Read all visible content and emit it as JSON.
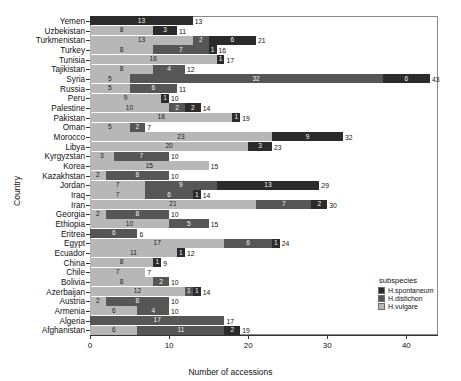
{
  "chart_data": {
    "type": "bar",
    "orientation": "horizontal",
    "stacked": true,
    "title": "",
    "xlabel": "Number of accessions",
    "ylabel": "Country",
    "xlim": [
      0,
      44
    ],
    "xticks": [
      0,
      10,
      20,
      30,
      40
    ],
    "grid": false,
    "legend": {
      "title": "subspecies",
      "position": "bottom-right",
      "entries": [
        {
          "name": "H.spontaneum",
          "color": "#2b2b2b"
        },
        {
          "name": "H.distichon",
          "color": "#565656"
        },
        {
          "name": "H.vulgare",
          "color": "#b7b7b7"
        }
      ]
    },
    "series": [
      {
        "name": "H.vulgare",
        "color": "#b7b7b7"
      },
      {
        "name": "H.distichon",
        "color": "#565656"
      },
      {
        "name": "H.spontaneum",
        "color": "#2b2b2b"
      }
    ],
    "categories": [
      "Yemen",
      "Uzbekistan",
      "Turkmenistan",
      "Turkey",
      "Tunisia",
      "Tajikistan",
      "Syria",
      "Russia",
      "Peru",
      "Palestine",
      "Pakistan",
      "Oman",
      "Morocco",
      "Libya",
      "Kyrgyzstan",
      "Korea",
      "Kazakhstan",
      "Jordan",
      "Iraq",
      "Iran",
      "Georgia",
      "Ethiopia",
      "Eritrea",
      "Egypt",
      "Ecuador",
      "China",
      "Chile",
      "Bolivia",
      "Azerbaijan",
      "Austria",
      "Armenia",
      "Algeria",
      "Afghanistan"
    ],
    "bars": [
      {
        "country": "Yemen",
        "segments": [
          {
            "subspecies": "H.spontaneum",
            "value": 13,
            "shade": "dark"
          }
        ],
        "total": 13
      },
      {
        "country": "Uzbekistan",
        "segments": [
          {
            "subspecies": "H.vulgare",
            "value": 8,
            "shade": "light"
          },
          {
            "subspecies": "H.spontaneum",
            "value": 3,
            "shade": "dark"
          }
        ],
        "total": 11
      },
      {
        "country": "Turkmenistan",
        "segments": [
          {
            "subspecies": "H.vulgare",
            "value": 13,
            "shade": "light"
          },
          {
            "subspecies": "H.distichon",
            "value": 2,
            "shade": "mid"
          },
          {
            "subspecies": "H.spontaneum",
            "value": 6,
            "shade": "dark"
          }
        ],
        "total": 21
      },
      {
        "country": "Turkey",
        "segments": [
          {
            "subspecies": "H.vulgare",
            "value": 8,
            "shade": "light"
          },
          {
            "subspecies": "H.distichon",
            "value": 7,
            "shade": "mid"
          },
          {
            "subspecies": "H.spontaneum",
            "value": 1,
            "shade": "dark"
          }
        ],
        "total": 16
      },
      {
        "country": "Tunisia",
        "segments": [
          {
            "subspecies": "H.vulgare",
            "value": 16,
            "shade": "light"
          },
          {
            "subspecies": "H.spontaneum",
            "value": 1,
            "shade": "dark"
          }
        ],
        "total": 17
      },
      {
        "country": "Tajikistan",
        "segments": [
          {
            "subspecies": "H.vulgare",
            "value": 8,
            "shade": "light"
          },
          {
            "subspecies": "H.distichon",
            "value": 4,
            "shade": "mid"
          }
        ],
        "total": 12
      },
      {
        "country": "Syria",
        "segments": [
          {
            "subspecies": "H.vulgare",
            "value": 5,
            "shade": "light"
          },
          {
            "subspecies": "H.distichon",
            "value": 32,
            "shade": "mid"
          },
          {
            "subspecies": "H.spontaneum",
            "value": 6,
            "shade": "dark"
          }
        ],
        "total": 43
      },
      {
        "country": "Russia",
        "segments": [
          {
            "subspecies": "H.vulgare",
            "value": 5,
            "shade": "light"
          },
          {
            "subspecies": "H.distichon",
            "value": 6,
            "shade": "mid"
          }
        ],
        "total": 11
      },
      {
        "country": "Peru",
        "segments": [
          {
            "subspecies": "H.vulgare",
            "value": 9,
            "shade": "light"
          },
          {
            "subspecies": "H.spontaneum",
            "value": 1,
            "shade": "dark"
          }
        ],
        "total": 10
      },
      {
        "country": "Palestine",
        "segments": [
          {
            "subspecies": "H.vulgare",
            "value": 10,
            "shade": "light"
          },
          {
            "subspecies": "H.distichon",
            "value": 2,
            "shade": "mid"
          },
          {
            "subspecies": "H.spontaneum",
            "value": 2,
            "shade": "dark"
          }
        ],
        "total": 14
      },
      {
        "country": "Pakistan",
        "segments": [
          {
            "subspecies": "H.vulgare",
            "value": 18,
            "shade": "light"
          },
          {
            "subspecies": "H.spontaneum",
            "value": 1,
            "shade": "dark"
          }
        ],
        "total": 19
      },
      {
        "country": "Oman",
        "segments": [
          {
            "subspecies": "H.vulgare",
            "value": 5,
            "shade": "light"
          },
          {
            "subspecies": "H.distichon",
            "value": 2,
            "shade": "mid"
          }
        ],
        "total": 7
      },
      {
        "country": "Morocco",
        "segments": [
          {
            "subspecies": "H.vulgare",
            "value": 23,
            "shade": "light"
          },
          {
            "subspecies": "H.spontaneum",
            "value": 9,
            "shade": "dark"
          }
        ],
        "total": 32
      },
      {
        "country": "Libya",
        "segments": [
          {
            "subspecies": "H.vulgare",
            "value": 20,
            "shade": "light"
          },
          {
            "subspecies": "H.spontaneum",
            "value": 3,
            "shade": "dark"
          }
        ],
        "total": 23
      },
      {
        "country": "Kyrgyzstan",
        "segments": [
          {
            "subspecies": "H.vulgare",
            "value": 3,
            "shade": "light"
          },
          {
            "subspecies": "H.distichon",
            "value": 7,
            "shade": "mid"
          }
        ],
        "total": 10
      },
      {
        "country": "Korea",
        "segments": [
          {
            "subspecies": "H.vulgare",
            "value": 15,
            "shade": "light"
          }
        ],
        "total": 15
      },
      {
        "country": "Kazakhstan",
        "segments": [
          {
            "subspecies": "H.vulgare",
            "value": 2,
            "shade": "light"
          },
          {
            "subspecies": "H.distichon",
            "value": 8,
            "shade": "mid"
          }
        ],
        "total": 10
      },
      {
        "country": "Jordan",
        "segments": [
          {
            "subspecies": "H.vulgare",
            "value": 7,
            "shade": "light"
          },
          {
            "subspecies": "H.distichon",
            "value": 9,
            "shade": "mid"
          },
          {
            "subspecies": "H.spontaneum",
            "value": 13,
            "shade": "dark"
          }
        ],
        "total": 29
      },
      {
        "country": "Iraq",
        "segments": [
          {
            "subspecies": "H.vulgare",
            "value": 7,
            "shade": "light"
          },
          {
            "subspecies": "H.distichon",
            "value": 6,
            "shade": "mid"
          },
          {
            "subspecies": "H.spontaneum",
            "value": 1,
            "shade": "dark"
          }
        ],
        "total": 14
      },
      {
        "country": "Iran",
        "segments": [
          {
            "subspecies": "H.vulgare",
            "value": 21,
            "shade": "light"
          },
          {
            "subspecies": "H.distichon",
            "value": 7,
            "shade": "mid"
          },
          {
            "subspecies": "H.spontaneum",
            "value": 2,
            "shade": "dark"
          }
        ],
        "total": 30
      },
      {
        "country": "Georgia",
        "segments": [
          {
            "subspecies": "H.vulgare",
            "value": 2,
            "shade": "light"
          },
          {
            "subspecies": "H.distichon",
            "value": 8,
            "shade": "mid"
          }
        ],
        "total": 10
      },
      {
        "country": "Ethiopia",
        "segments": [
          {
            "subspecies": "H.vulgare",
            "value": 10,
            "shade": "light"
          },
          {
            "subspecies": "H.distichon",
            "value": 5,
            "shade": "mid"
          }
        ],
        "total": 15
      },
      {
        "country": "Eritrea",
        "segments": [
          {
            "subspecies": "H.distichon",
            "value": 6,
            "shade": "mid"
          }
        ],
        "total": 6
      },
      {
        "country": "Egypt",
        "segments": [
          {
            "subspecies": "H.vulgare",
            "value": 17,
            "shade": "light"
          },
          {
            "subspecies": "H.distichon",
            "value": 6,
            "shade": "mid"
          },
          {
            "subspecies": "H.spontaneum",
            "value": 1,
            "shade": "dark"
          }
        ],
        "total": 24
      },
      {
        "country": "Ecuador",
        "segments": [
          {
            "subspecies": "H.vulgare",
            "value": 11,
            "shade": "light"
          },
          {
            "subspecies": "H.spontaneum",
            "value": 1,
            "shade": "dark"
          }
        ],
        "total": 12
      },
      {
        "country": "China",
        "segments": [
          {
            "subspecies": "H.vulgare",
            "value": 8,
            "shade": "light"
          },
          {
            "subspecies": "H.spontaneum",
            "value": 1,
            "shade": "dark"
          }
        ],
        "total": 9
      },
      {
        "country": "Chile",
        "segments": [
          {
            "subspecies": "H.vulgare",
            "value": 7,
            "shade": "light"
          }
        ],
        "total": 7
      },
      {
        "country": "Bolivia",
        "segments": [
          {
            "subspecies": "H.vulgare",
            "value": 8,
            "shade": "light"
          },
          {
            "subspecies": "H.distichon",
            "value": 2,
            "shade": "mid"
          }
        ],
        "total": 10
      },
      {
        "country": "Azerbaijan",
        "segments": [
          {
            "subspecies": "H.vulgare",
            "value": 12,
            "shade": "light"
          },
          {
            "subspecies": "H.distichon",
            "value": 1,
            "shade": "mid"
          },
          {
            "subspecies": "H.spontaneum",
            "value": 1,
            "shade": "dark"
          }
        ],
        "total": 14
      },
      {
        "country": "Austria",
        "segments": [
          {
            "subspecies": "H.vulgare",
            "value": 2,
            "shade": "light"
          },
          {
            "subspecies": "H.distichon",
            "value": 8,
            "shade": "mid"
          }
        ],
        "total": 10
      },
      {
        "country": "Armenia",
        "segments": [
          {
            "subspecies": "H.vulgare",
            "value": 6,
            "shade": "light"
          },
          {
            "subspecies": "H.distichon",
            "value": 4,
            "shade": "mid"
          }
        ],
        "total": 10
      },
      {
        "country": "Algeria",
        "segments": [
          {
            "subspecies": "H.distichon",
            "value": 17,
            "shade": "mid"
          }
        ],
        "total": 17
      },
      {
        "country": "Afghanistan",
        "segments": [
          {
            "subspecies": "H.vulgare",
            "value": 6,
            "shade": "light"
          },
          {
            "subspecies": "H.distichon",
            "value": 11,
            "shade": "mid"
          },
          {
            "subspecies": "H.spontaneum",
            "value": 2,
            "shade": "dark"
          }
        ],
        "total": 19
      }
    ]
  }
}
